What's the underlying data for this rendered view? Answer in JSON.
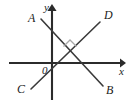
{
  "figure": {
    "background_color": "#ffffff",
    "axis_color": "#2b2b2b",
    "ray_color": "#3a3a3a",
    "right_angle_color": "#a9a9a9",
    "label_color": "#1c1c1c",
    "axes": {
      "x_axis": {
        "name": "x-axis",
        "label": "x",
        "label_x": 119,
        "label_y": 66,
        "x1": 9,
        "y1": 63,
        "x2": 121,
        "y2": 63,
        "arrow": "right"
      },
      "y_axis": {
        "name": "y-axis",
        "label": "y",
        "label_x": 44,
        "label_y": 2,
        "x1": 52,
        "y1": 100,
        "x2": 52,
        "y2": 9,
        "arrow": "up"
      },
      "origin": {
        "label": "0",
        "label_x": 42,
        "label_y": 65,
        "x": 52,
        "y": 63
      }
    },
    "rays": [
      {
        "name": "ray-AB",
        "start_label": "A",
        "end_label": "B",
        "x1": 41,
        "y1": 19,
        "x2": 103,
        "y2": 86,
        "start_label_x": 28,
        "start_label_y": 12,
        "end_label_x": 106,
        "end_label_y": 84
      },
      {
        "name": "ray-CD",
        "start_label": "C",
        "end_label": "D",
        "x1": 31,
        "y1": 89,
        "x2": 100,
        "y2": 22,
        "start_label_x": 17,
        "start_label_y": 83,
        "end_label_x": 104,
        "end_label_y": 9
      }
    ],
    "intersection": {
      "name": "intersection-point",
      "x": 70,
      "y": 53,
      "right_angle_mark": "M 63.5,46.5 L 70,40 L 76.5,46.5"
    }
  }
}
